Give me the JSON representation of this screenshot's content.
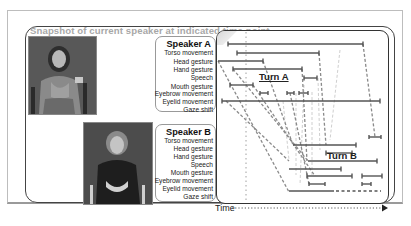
{
  "title": "Snapshot of current speaker at indicated time point",
  "speakers": [
    {
      "name": "Speaker A",
      "turn_label": "Turn A",
      "tiers": [
        "Torso movement",
        "Head gesture",
        "Hand gesture",
        "Speech",
        "Mouth gesture",
        "Eyebrow movement",
        "Eyelid movement",
        "Gaze shift"
      ]
    },
    {
      "name": "Speaker B",
      "turn_label": "Turn B",
      "tiers": [
        "Torso movement",
        "Head gesture",
        "Hand gesture",
        "Speech",
        "Mouth gesture",
        "Eyebrow movement",
        "Eyelid movement",
        "Gaze shift"
      ]
    }
  ],
  "axis": {
    "label": "Time"
  },
  "colors": {
    "bar": "#555555",
    "dashed_link": "#8a8a8a",
    "light_link": "#cfcfcf",
    "title": "#a8a8a8",
    "frame": "#444444"
  },
  "segments": {
    "speaker_a": {
      "torso_movement": [
        [
          228,
          363
        ]
      ],
      "head_gesture": [
        [
          237,
          319
        ]
      ],
      "hand_gesture": [
        [
          218,
          263
        ]
      ],
      "speech": [
        [
          233,
          302
        ]
      ],
      "mouth_gesture": [
        [
          304,
          317
        ]
      ],
      "eyebrow_movement": [
        [
          230,
          253
        ]
      ],
      "eyelid_movement": [
        [
          260,
          268
        ],
        [
          287,
          294
        ],
        [
          299,
          308
        ]
      ],
      "gaze_shift": [
        [
          222,
          380
        ]
      ]
    },
    "speaker_b": {
      "torso_movement": [
        [
          369,
          381
        ]
      ],
      "head_gesture": [
        [
          293,
          356
        ]
      ],
      "hand_gesture": [
        [
          326,
          352
        ]
      ],
      "speech": [
        [
          308,
          377
        ]
      ],
      "mouth_gesture": [
        [
          289,
          341
        ]
      ],
      "eyebrow_movement": [
        [
          307,
          352
        ],
        [
          362,
          382
        ]
      ],
      "eyelid_movement": [
        [
          309,
          325
        ],
        [
          362,
          371
        ]
      ],
      "gaze_shift": [
        [
          289,
          334
        ]
      ],
      "gaze_shift_continued_dashed": [
        [
          334,
          381
        ]
      ]
    }
  }
}
